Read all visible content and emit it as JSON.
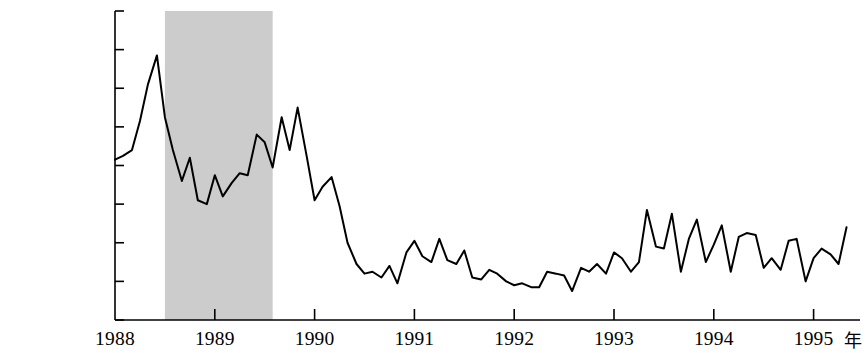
{
  "chart_data": {
    "type": "line",
    "title": "",
    "subtitle": "",
    "xlabel": "年",
    "ylabel": "",
    "grid": false,
    "legend": null,
    "xlim": [
      1988.0,
      1995.33
    ],
    "ylim": [
      0,
      160000
    ],
    "x_tick_labels": [
      "1988",
      "1989",
      "1990",
      "1991",
      "1992",
      "1993",
      "1994",
      "1995"
    ],
    "x_tick_values": [
      1988,
      1989,
      1990,
      1991,
      1992,
      1993,
      1994,
      1995
    ],
    "y_tick_labels": [
      "0.00",
      "20 000.00",
      "40 000.00",
      "60 000.00",
      "80 000.00",
      "100 000.00",
      "120 000.00",
      "140 000.00",
      "160 000.00"
    ],
    "y_tick_values": [
      0,
      20000,
      40000,
      60000,
      80000,
      100000,
      120000,
      140000,
      160000
    ],
    "line_color": "#000000",
    "line_width": 2.0,
    "shaded_region": {
      "label": "",
      "color": "#cccccc",
      "x_start": 1988.5,
      "x_end": 1989.58
    },
    "series": [
      {
        "name": "",
        "x": [
          1988.0,
          1988.08,
          1988.17,
          1988.25,
          1988.33,
          1988.42,
          1988.5,
          1988.58,
          1988.67,
          1988.75,
          1988.83,
          1988.92,
          1989.0,
          1989.08,
          1989.17,
          1989.25,
          1989.33,
          1989.42,
          1989.5,
          1989.58,
          1989.67,
          1989.75,
          1989.83,
          1989.92,
          1990.0,
          1990.08,
          1990.17,
          1990.25,
          1990.33,
          1990.42,
          1990.5,
          1990.58,
          1990.67,
          1990.75,
          1990.83,
          1990.92,
          1991.0,
          1991.08,
          1991.17,
          1991.25,
          1991.33,
          1991.42,
          1991.5,
          1991.58,
          1991.67,
          1991.75,
          1991.83,
          1991.92,
          1992.0,
          1992.08,
          1992.17,
          1992.25,
          1992.33,
          1992.42,
          1992.5,
          1992.58,
          1992.67,
          1992.75,
          1992.83,
          1992.92,
          1993.0,
          1993.08,
          1993.17,
          1993.25,
          1993.33,
          1993.42,
          1993.5,
          1993.58,
          1993.67,
          1993.75,
          1993.83,
          1993.92,
          1994.0,
          1994.08,
          1994.17,
          1994.25,
          1994.33,
          1994.42,
          1994.5,
          1994.58,
          1994.67,
          1994.75,
          1994.83,
          1994.92,
          1995.0,
          1995.08,
          1995.17,
          1995.25,
          1995.33
        ],
        "values": [
          83000,
          85000,
          88000,
          103000,
          122000,
          137000,
          105000,
          88000,
          72000,
          84000,
          62000,
          60000,
          75000,
          64000,
          71000,
          76000,
          75000,
          96000,
          92000,
          79000,
          105000,
          88000,
          110000,
          85000,
          62000,
          69000,
          74000,
          59000,
          40000,
          29000,
          24000,
          25000,
          22000,
          28000,
          19000,
          35000,
          41000,
          33000,
          30000,
          42000,
          31000,
          29000,
          36000,
          22000,
          21000,
          26000,
          24000,
          20000,
          18000,
          19000,
          17000,
          17000,
          25000,
          24000,
          23000,
          15000,
          27000,
          25000,
          29000,
          24000,
          35000,
          32000,
          25000,
          30000,
          57000,
          38000,
          37000,
          55000,
          25000,
          42000,
          52000,
          30000,
          39000,
          49000,
          25000,
          43000,
          45000,
          44000,
          27000,
          32000,
          26000,
          41000,
          42000,
          20000,
          32000,
          37000,
          34000,
          29000,
          48000
        ]
      }
    ]
  },
  "axis": {
    "y_unit_note": "",
    "x_unit_note": "年"
  }
}
